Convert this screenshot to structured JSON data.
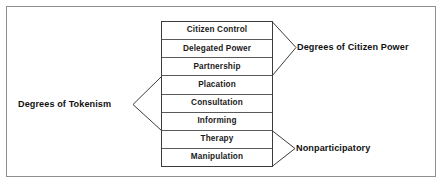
{
  "diagram": {
    "frame_color": "#8e8e8e",
    "ladder_border_color": "#3c3c3c",
    "rung_divider_color": "#5a5a5a",
    "text_color": "#111111",
    "background": "#ffffff",
    "rungs": [
      {
        "label": "Citizen Control"
      },
      {
        "label": "Delegated Power"
      },
      {
        "label": "Partnership"
      },
      {
        "label": "Placation"
      },
      {
        "label": "Consultation"
      },
      {
        "label": "Informing"
      },
      {
        "label": "Therapy"
      },
      {
        "label": "Manipulation"
      }
    ],
    "groups": [
      {
        "label": "Degrees of Citizen Power",
        "side": "right",
        "covers_rungs": [
          "Citizen Control",
          "Delegated Power",
          "Partnership"
        ]
      },
      {
        "label": "Degrees of Tokenism",
        "side": "left",
        "covers_rungs": [
          "Placation",
          "Consultation",
          "Informing"
        ]
      },
      {
        "label": "Nonparticipatory",
        "side": "right",
        "covers_rungs": [
          "Therapy",
          "Manipulation"
        ]
      }
    ]
  }
}
